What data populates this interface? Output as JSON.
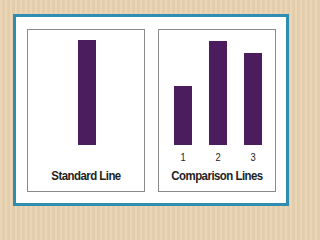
{
  "colors": {
    "background": "#e9d4b2",
    "frame_border": "#2e8db0",
    "bar_fill": "#4b1d5e",
    "panel_border": "#8a8a8a"
  },
  "standard": {
    "caption": "Standard Line",
    "bar": {
      "height_px": 105
    }
  },
  "comparison": {
    "caption": "Comparison Lines",
    "bars": [
      {
        "label": "1",
        "height_px": 59
      },
      {
        "label": "2",
        "height_px": 104
      },
      {
        "label": "3",
        "height_px": 92
      }
    ]
  },
  "chart_data": {
    "type": "bar",
    "title": "",
    "panels": [
      {
        "name": "Standard Line",
        "categories": [
          ""
        ],
        "values": [
          105
        ]
      },
      {
        "name": "Comparison Lines",
        "categories": [
          "1",
          "2",
          "3"
        ],
        "values": [
          59,
          104,
          92
        ]
      }
    ],
    "xlabel": "",
    "ylabel": "",
    "grid": false,
    "note": "Values are relative line lengths in pixels (Asch conformity line-judgment task); line 2 matches the standard."
  }
}
